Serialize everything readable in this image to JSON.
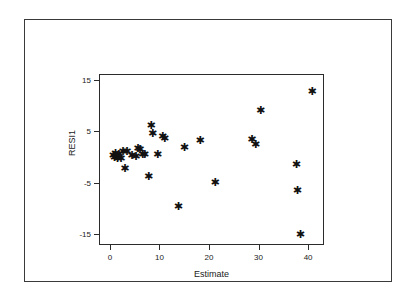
{
  "chart_data": {
    "type": "scatter",
    "title": "",
    "xlabel": "Estimate",
    "ylabel": "RESI1",
    "xlim": [
      -2,
      43
    ],
    "ylim": [
      -17,
      16
    ],
    "xticks": [
      0,
      10,
      20,
      30,
      40
    ],
    "xtick_labels": [
      "0",
      "10",
      "20",
      "30",
      "40"
    ],
    "yticks": [
      15,
      5,
      -5,
      -15
    ],
    "ytick_labels": [
      "15",
      "5",
      "-5",
      "-15"
    ],
    "grid": false,
    "legend": null,
    "marker": "asterisk",
    "marker_color": "#111111",
    "frame_color": "#2b2b2b",
    "points": [
      {
        "x": 0.6,
        "y": 0.3
      },
      {
        "x": 0.9,
        "y": -0.1
      },
      {
        "x": 1.1,
        "y": 0.6
      },
      {
        "x": 1.3,
        "y": 0.1
      },
      {
        "x": 1.5,
        "y": -0.4
      },
      {
        "x": 1.8,
        "y": 0.4
      },
      {
        "x": 2.2,
        "y": -0.3
      },
      {
        "x": 2.6,
        "y": 1.0
      },
      {
        "x": 3.0,
        "y": -2.2
      },
      {
        "x": 3.4,
        "y": 1.1
      },
      {
        "x": 4.4,
        "y": 0.2
      },
      {
        "x": 5.2,
        "y": 0.0
      },
      {
        "x": 5.6,
        "y": 1.6
      },
      {
        "x": 6.0,
        "y": 1.4
      },
      {
        "x": 6.6,
        "y": 0.5
      },
      {
        "x": 7.0,
        "y": 0.4
      },
      {
        "x": 7.8,
        "y": -3.8
      },
      {
        "x": 8.3,
        "y": 6.2
      },
      {
        "x": 8.6,
        "y": 4.6
      },
      {
        "x": 9.6,
        "y": 0.4
      },
      {
        "x": 10.6,
        "y": 4.0
      },
      {
        "x": 11.0,
        "y": 3.6
      },
      {
        "x": 13.8,
        "y": -9.6
      },
      {
        "x": 15.0,
        "y": 1.9
      },
      {
        "x": 18.2,
        "y": 3.2
      },
      {
        "x": 21.2,
        "y": -5.0
      },
      {
        "x": 28.6,
        "y": 3.4
      },
      {
        "x": 29.4,
        "y": 2.4
      },
      {
        "x": 30.4,
        "y": 9.0
      },
      {
        "x": 37.6,
        "y": -1.4
      },
      {
        "x": 37.8,
        "y": -6.5
      },
      {
        "x": 38.4,
        "y": -15.2
      },
      {
        "x": 40.8,
        "y": 12.8
      }
    ]
  }
}
